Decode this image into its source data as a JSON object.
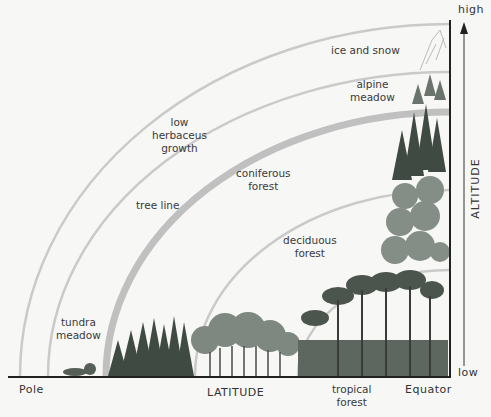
{
  "diagram": {
    "type": "vegetation zones by latitude and altitude",
    "x_axis": {
      "label": "LATITUDE",
      "left_end": "Pole",
      "right_end": "Equator"
    },
    "y_axis": {
      "label": "ALTITUDE",
      "top_end": "high",
      "bottom_end": "low"
    },
    "zones": [
      {
        "label": "ice and snow"
      },
      {
        "label": "alpine meadow",
        "lines": [
          "alpine",
          "meadow"
        ]
      },
      {
        "label": "low herbaceus growth",
        "lines": [
          "low",
          "herbaceus",
          "growth"
        ]
      },
      {
        "label": "tree line"
      },
      {
        "label": "coniferous forest",
        "lines": [
          "coniferous",
          "forest"
        ]
      },
      {
        "label": "deciduous forest",
        "lines": [
          "deciduous",
          "forest"
        ]
      },
      {
        "label": "tundra meadow",
        "lines": [
          "tundra",
          "meadow"
        ]
      },
      {
        "label": "tropical forest",
        "lines": [
          "tropical",
          "forest"
        ]
      }
    ],
    "colors": {
      "arc": "#c8c8c8",
      "tree_line_arc": "#bdbdbd",
      "axis": "#222222",
      "foliage_dark": "#3d4a40",
      "foliage_mid": "#7a857c",
      "background": "#f7f7f5"
    }
  }
}
